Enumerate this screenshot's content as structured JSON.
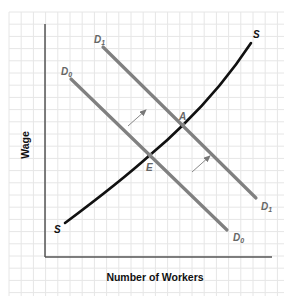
{
  "chart_data": {
    "type": "line",
    "title": "",
    "xlabel": "Number of Workers",
    "ylabel": "Wage",
    "grid": true,
    "legend": null,
    "series": [
      {
        "name": "D0",
        "label_main": "D",
        "label_sub": "0",
        "kind": "demand",
        "color": "#808080",
        "shape": "straight, downward sloping",
        "points_px": [
          [
            71,
            79
          ],
          [
            227,
            230
          ]
        ]
      },
      {
        "name": "D1",
        "label_main": "D",
        "label_sub": "1",
        "kind": "demand",
        "color": "#808080",
        "shape": "straight, downward sloping (shifted right of D0)",
        "points_px": [
          [
            103,
            47
          ],
          [
            256,
            198
          ]
        ]
      },
      {
        "name": "S",
        "label_main": "S",
        "kind": "supply",
        "color": "#111111",
        "shape": "upward sloping, convex",
        "points_px": [
          [
            65,
            223
          ],
          [
            150,
            155
          ],
          [
            183,
            125
          ],
          [
            251,
            43
          ]
        ]
      }
    ],
    "points": [
      {
        "name": "E",
        "description": "Equilibrium of D0 and S",
        "px": [
          150,
          155
        ]
      },
      {
        "name": "A",
        "description": "Equilibrium of D1 and S",
        "px": [
          183,
          125
        ]
      }
    ],
    "annotations": [
      {
        "type": "arrow",
        "description": "Demand shift from D0 to D1",
        "from_px": [
          128,
          126
        ],
        "to_px": [
          146,
          110
        ]
      },
      {
        "type": "arrow",
        "description": "Demand shift from D0 to D1",
        "from_px": [
          192,
          172
        ],
        "to_px": [
          210,
          156
        ]
      }
    ],
    "axes": {
      "x_ticks": [],
      "y_ticks": []
    }
  },
  "labels": {
    "ylabel": "Wage",
    "xlabel": "Number of Workers",
    "d_main": "D",
    "d0_sub": "0",
    "d1_sub": "1",
    "s": "S",
    "point_a": "A",
    "point_e": "E"
  }
}
